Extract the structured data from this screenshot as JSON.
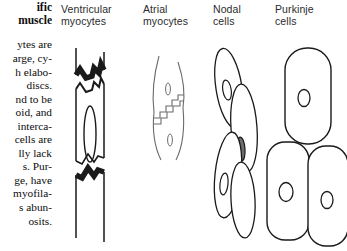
{
  "figure": {
    "kind": "histology-diagram",
    "stroke_color": "#1a1a1a",
    "fill_color": "#ffffff",
    "disc_color": "#1a1a1a",
    "nucleus_color": "#4a4a4a"
  },
  "sidebar": {
    "title_lines": [
      "ific",
      "muscle"
    ],
    "body_lines": [
      "ytes  are",
      "arge, cy-",
      "h elabo-",
      "discs.",
      "nd to be",
      "oid, and",
      "interca-",
      "cells are",
      "lly  lack",
      "s.    Pur-",
      "ge,  have",
      "myofila-",
      "s  abun-",
      "osits."
    ]
  },
  "columns": [
    {
      "id": "ventricular",
      "header_lines": [
        "Ventricular",
        "myocytes"
      ],
      "cell_shape": "long-cylindrical-branching",
      "features": [
        "intercalated-disc-top",
        "central-elongated-nucleus",
        "intercalated-disc-bottom"
      ]
    },
    {
      "id": "atrial",
      "header_lines": [
        "Atrial",
        "myocytes"
      ],
      "cell_shape": "spindle-tapered",
      "features": [
        "staircase-intercalated-disc",
        "two-small-nuclei"
      ]
    },
    {
      "id": "nodal",
      "header_lines": [
        "Nodal",
        "cells"
      ],
      "cell_shape": "small-overlapping-ovals",
      "features": [
        "four-cells",
        "dark-central-nuclei"
      ]
    },
    {
      "id": "purkinje",
      "header_lines": [
        "Purkinje",
        "cells"
      ],
      "cell_shape": "large-rounded-rectangular",
      "features": [
        "three-cells",
        "small-oval-nuclei"
      ]
    }
  ]
}
